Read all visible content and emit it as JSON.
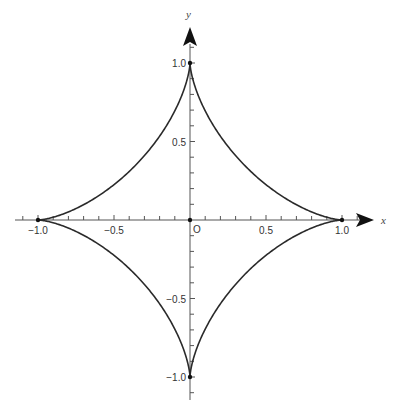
{
  "chart_data": {
    "type": "line",
    "title": "",
    "subtitle": "",
    "curve_name": "astroid",
    "equation": "x = cos^3(t), y = sin^3(t)",
    "xlabel": "x",
    "ylabel": "y",
    "origin_label": "O",
    "xlim": [
      -1.1,
      1.2
    ],
    "ylim": [
      -1.1,
      1.2
    ],
    "grid": false,
    "legend": null,
    "x_ticks": [
      {
        "value": -1.0,
        "label": "−1.0"
      },
      {
        "value": -0.5,
        "label": "−0.5"
      },
      {
        "value": 0.5,
        "label": "0.5"
      },
      {
        "value": 1.0,
        "label": "1.0"
      }
    ],
    "y_ticks": [
      {
        "value": 1.0,
        "label": "1.0"
      },
      {
        "value": 0.5,
        "label": "0.5"
      },
      {
        "value": -0.5,
        "label": "−0.5"
      },
      {
        "value": -1.0,
        "label": "−1.0"
      }
    ],
    "minor_tick_step": 0.1,
    "cusp_points": [
      {
        "x": 1,
        "y": 0
      },
      {
        "x": 0,
        "y": 1
      },
      {
        "x": -1,
        "y": 0
      },
      {
        "x": 0,
        "y": -1
      }
    ],
    "series": [
      {
        "name": "astroid",
        "color": "#2a2a2a",
        "x": [
          1.0,
          0.926,
          0.716,
          0.432,
          0.177,
          0.024,
          0.0,
          -0.024,
          -0.177,
          -0.432,
          -0.716,
          -0.926,
          -1.0,
          -0.926,
          -0.716,
          -0.432,
          -0.177,
          -0.024,
          0.0,
          0.024,
          0.177,
          0.432,
          0.716,
          0.926,
          1.0
        ],
        "y": [
          0.0,
          0.024,
          0.177,
          0.432,
          0.716,
          0.926,
          1.0,
          0.926,
          0.716,
          0.432,
          0.177,
          0.024,
          0.0,
          -0.024,
          -0.177,
          -0.432,
          -0.716,
          -0.926,
          -1.0,
          -0.926,
          -0.716,
          -0.432,
          -0.177,
          -0.024,
          0.0
        ]
      }
    ]
  }
}
